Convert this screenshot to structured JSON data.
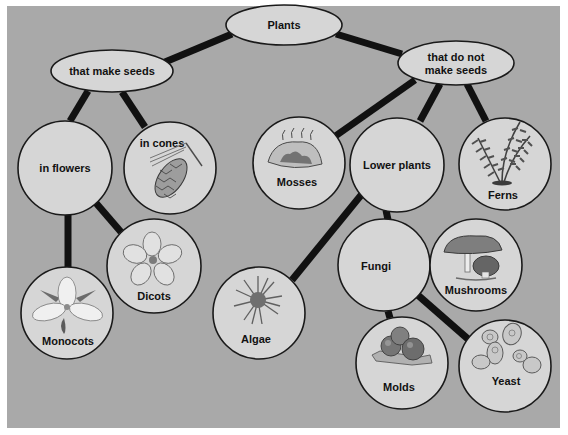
{
  "diagram": {
    "title": "Plants",
    "type": "concept-map",
    "colors": {
      "background": "#a9a9a9",
      "node_fill": "#d6d6d6",
      "node_stroke": "#1a1a1a",
      "connector": "#111111",
      "text": "#111111"
    },
    "nodes": {
      "plants": {
        "label": "Plants",
        "shape": "ellipse"
      },
      "make_seeds": {
        "label": "that make seeds",
        "shape": "ellipse"
      },
      "no_seeds": {
        "label_line1": "that do not",
        "label_line2": "make seeds",
        "shape": "ellipse"
      },
      "in_flowers": {
        "label": "in flowers",
        "shape": "circle"
      },
      "in_cones": {
        "label": "in cones",
        "shape": "circle",
        "icon": "pine-cone-icon"
      },
      "mosses": {
        "label": "Mosses",
        "shape": "circle",
        "icon": "moss-icon"
      },
      "lower_plants": {
        "label": "Lower plants",
        "shape": "circle"
      },
      "ferns": {
        "label": "Ferns",
        "shape": "circle",
        "icon": "fern-icon"
      },
      "dicots": {
        "label": "Dicots",
        "shape": "circle",
        "icon": "five-petal-flower-icon"
      },
      "monocots": {
        "label": "Monocots",
        "shape": "circle",
        "icon": "trillium-flower-icon"
      },
      "algae": {
        "label": "Algae",
        "shape": "circle",
        "icon": "algae-icon"
      },
      "fungi": {
        "label": "Fungi",
        "shape": "circle"
      },
      "mushrooms": {
        "label": "Mushrooms",
        "shape": "circle",
        "icon": "mushroom-icon"
      },
      "molds": {
        "label": "Molds",
        "shape": "circle",
        "icon": "mold-icon"
      },
      "yeast": {
        "label": "Yeast",
        "shape": "circle",
        "icon": "yeast-cells-icon"
      }
    },
    "edges": [
      [
        "plants",
        "make_seeds"
      ],
      [
        "plants",
        "no_seeds"
      ],
      [
        "make_seeds",
        "in_flowers"
      ],
      [
        "make_seeds",
        "in_cones"
      ],
      [
        "in_flowers",
        "monocots"
      ],
      [
        "in_flowers",
        "dicots"
      ],
      [
        "no_seeds",
        "mosses"
      ],
      [
        "no_seeds",
        "lower_plants"
      ],
      [
        "no_seeds",
        "ferns"
      ],
      [
        "lower_plants",
        "algae"
      ],
      [
        "lower_plants",
        "fungi"
      ],
      [
        "fungi",
        "mushrooms"
      ],
      [
        "fungi",
        "molds"
      ],
      [
        "fungi",
        "yeast"
      ]
    ]
  }
}
